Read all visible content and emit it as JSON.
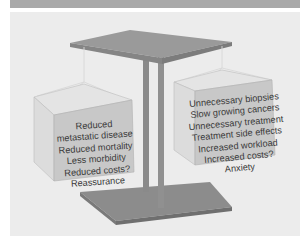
{
  "figure": {
    "type": "balance-scale-diagram",
    "colors": {
      "background": "#ececec",
      "banner": "#a9a9a9",
      "beam_top": "#9a9a9a",
      "beam_side": "#858585",
      "pillar": "#8a8a8a",
      "base_top": "#8c8c8c",
      "base_side": "#6f6f6f",
      "box_front": "#c8c8c8",
      "box_side": "#dcdcdc",
      "box_top": "#e4e4e4",
      "text": "#3a3a3a"
    },
    "left_box": {
      "name": "benefits",
      "items": [
        "Reduced",
        "metastatic disease",
        "Reduced mortality",
        "Less morbidity",
        "Reduced costs?",
        "Reassurance"
      ]
    },
    "right_box": {
      "name": "harms",
      "items": [
        "Unnecessary biopsies",
        "Slow growing cancers",
        "Unnecessary treatment",
        "Treatment side effects",
        "Increased workload",
        "Increased costs?",
        "Anxiety"
      ]
    }
  }
}
